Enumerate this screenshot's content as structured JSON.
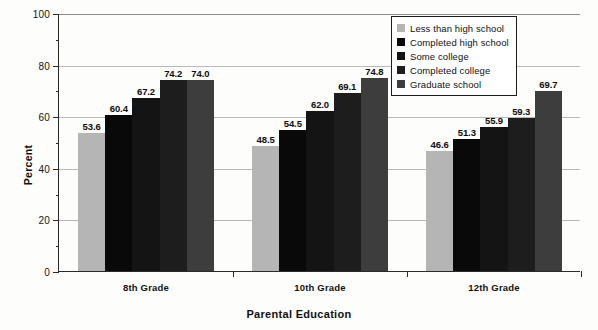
{
  "chart_data": {
    "type": "bar",
    "title": "",
    "xlabel": "Parental Education",
    "ylabel": "Percent",
    "ylim": [
      0,
      100
    ],
    "yticks": [
      0,
      20,
      40,
      60,
      80,
      100
    ],
    "yticks_minor": [
      10,
      30,
      50,
      70,
      90
    ],
    "grid": true,
    "legend_position": "top-right",
    "categories": [
      "8th Grade",
      "10th Grade",
      "12th Grade"
    ],
    "series": [
      {
        "name": "Less than high school",
        "color": "#b5b5b5",
        "values": [
          53.6,
          48.5,
          46.6
        ],
        "labels": [
          "53.6",
          "48.5",
          "46.6"
        ]
      },
      {
        "name": "Completed high school",
        "color": "#090909",
        "values": [
          60.4,
          54.5,
          51.3
        ],
        "labels": [
          "60.4",
          "54.5",
          "51.3"
        ]
      },
      {
        "name": "Some college",
        "color": "#141414",
        "values": [
          67.2,
          62.0,
          55.9
        ],
        "labels": [
          "67.2",
          "62.0",
          "55.9"
        ]
      },
      {
        "name": "Completed college",
        "color": "#1d1d1d",
        "values": [
          74.2,
          69.1,
          59.3
        ],
        "labels": [
          "74.2",
          "69.1",
          "59.3"
        ]
      },
      {
        "name": "Graduate school",
        "color": "#3d3d3d",
        "values": [
          74.0,
          74.8,
          69.7
        ],
        "labels": [
          "74.0",
          "74.8",
          "69.7"
        ]
      }
    ]
  },
  "legend": {
    "items": [
      {
        "label": "Less than high school",
        "color": "#b5b5b5"
      },
      {
        "label": "Completed high school",
        "color": "#090909"
      },
      {
        "label": "Some college",
        "color": "#141414"
      },
      {
        "label": "Completed college",
        "color": "#1d1d1d"
      },
      {
        "label": "Graduate school",
        "color": "#3d3d3d"
      }
    ]
  },
  "axes": {
    "y_title": "Percent",
    "x_title": "Parental Education",
    "y_tick_labels": [
      "0",
      "20",
      "40",
      "60",
      "80",
      "100"
    ],
    "x_tick_labels": [
      "8th Grade",
      "10th Grade",
      "12th Grade"
    ]
  }
}
